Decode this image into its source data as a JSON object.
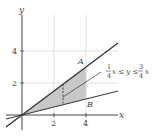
{
  "diagram": {
    "axes": {
      "x_label": "x",
      "y_label": "y",
      "x_ticks": [
        "2",
        "4"
      ],
      "y_ticks": [
        "2",
        "4"
      ]
    },
    "lines": [
      {
        "name": "upper",
        "equation": "y = 3/4 x"
      },
      {
        "name": "lower",
        "equation": "y = 1/4 x"
      }
    ],
    "points": {
      "A": "A",
      "B": "B"
    },
    "annotation": {
      "frac1_num": "1",
      "frac1_den": "4",
      "mid": "x ≤ y ≤",
      "frac2_num": "3",
      "frac2_den": "4",
      "tail": "x"
    },
    "shaded_region": "1/4 x ≤ y ≤ 3/4 x, 0 ≤ x ≤ 4",
    "colors": {
      "shade": "#c8c8c8",
      "grid": "#d8d8d8",
      "line": "#333333"
    }
  }
}
